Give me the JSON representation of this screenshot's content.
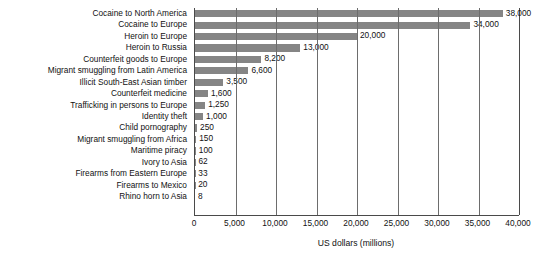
{
  "chart_data": {
    "type": "bar",
    "orientation": "horizontal",
    "title": "",
    "subtitle": "",
    "xlabel": "US dollars (millions)",
    "ylabel": "",
    "xlim": [
      0,
      40000
    ],
    "grid": true,
    "legend": null,
    "bar_color": "#858585",
    "axis_color": "#4a4a4a",
    "xticks": [
      0,
      5000,
      10000,
      15000,
      20000,
      25000,
      30000,
      35000,
      40000
    ],
    "xtick_labels": [
      "0",
      "5,000",
      "10,000",
      "15,000",
      "20,000",
      "25,000",
      "30,000",
      "35,000",
      "40,000"
    ],
    "categories": [
      "Cocaine to North America",
      "Cocaine to Europe",
      "Heroin to Europe",
      "Heroin to Russia",
      "Counterfeit goods to Europe",
      "Migrant smuggling from Latin America",
      "Illicit South-East Asian timber",
      "Counterfeit medicine",
      "Trafficking in persons to Europe",
      "Identity theft",
      "Child pornography",
      "Migrant smuggling from Africa",
      "Maritime piracy",
      "Ivory to Asia",
      "Firearms from Eastern Europe",
      "Firearms to Mexico",
      "Rhino horn to Asia"
    ],
    "values": [
      38000,
      34000,
      20000,
      13000,
      8200,
      6600,
      3500,
      1600,
      1250,
      1000,
      250,
      150,
      100,
      62,
      33,
      20,
      8
    ],
    "data_labels": [
      "38,000",
      "34,000",
      "20,000",
      "13,000",
      "8,200",
      "6,600",
      "3,500",
      "1,600",
      "1,250",
      "1,000",
      "250",
      "150",
      "100",
      "62",
      "33",
      "20",
      "8"
    ]
  }
}
